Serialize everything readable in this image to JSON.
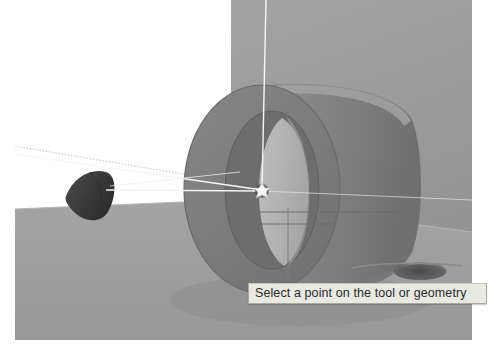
{
  "viewport": {
    "width": 498,
    "height": 354,
    "background_color": "#ffffff",
    "name": "cad-3d-viewport"
  },
  "tooltip": {
    "text": "Select a point on the tool or geometry",
    "background_color": "#e9e9e4",
    "border_color": "#a9a9a2",
    "text_color": "#2a2a2a"
  },
  "scene": {
    "backdrop": {
      "label": "back-wall-plane",
      "color": "#9a9a9a"
    },
    "floor": {
      "label": "floor-plane",
      "color": "#9e9e9e"
    },
    "part": {
      "label": "cylindrical-ring-part",
      "body_color": "#8a8a8a",
      "front_face_color": "#7d7d7d",
      "bore_color": "#b4b4b4",
      "highlight_color": "#a0a0a0"
    },
    "tool": {
      "label": "conical-cutting-tool",
      "color": "#3d3d3d"
    },
    "hole": {
      "label": "counterbore-hole",
      "color": "#5a5a5a"
    },
    "selection_point": {
      "label": "selection-point-marker",
      "color": "#f2f2f2",
      "x": 262,
      "y": 191
    },
    "axis_lines": {
      "label": "construction-axis-lines",
      "color": "#f4f4f4"
    },
    "dotted_line": {
      "label": "dotted-guide-line",
      "color": "#c9c9c9"
    }
  }
}
